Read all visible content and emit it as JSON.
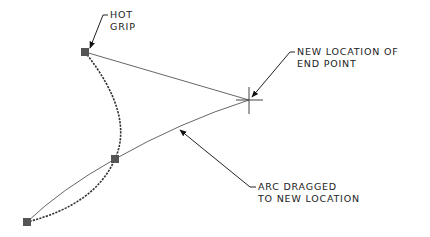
{
  "diagram": {
    "colors": {
      "line": "#555555",
      "dashed_arc": "#333333",
      "grip": "#555555",
      "text": "#222222",
      "background": "#ffffff"
    },
    "labels": {
      "hot_grip": {
        "line1": "HOT",
        "line2": "GRIP"
      },
      "new_location": {
        "line1": "NEW LOCATION OF",
        "line2": "END POINT"
      },
      "arc_dragged": {
        "line1": "ARC DRAGGED",
        "line2": "TO NEW LOCATION"
      }
    },
    "points": {
      "hot_grip": [
        85,
        52
      ],
      "mid_grip": [
        115,
        159
      ],
      "end_grip": [
        27,
        222
      ],
      "new_end_point": [
        249,
        100
      ]
    }
  }
}
